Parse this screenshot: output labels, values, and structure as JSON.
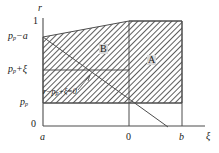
{
  "figure": {
    "type": "math-region-diagram",
    "axes": {
      "y": {
        "name": "r",
        "ticks": [
          "0",
          "p_p",
          "p_p+ξ",
          "p_p−a",
          "1"
        ]
      },
      "x": {
        "name": "ξ",
        "ticks": [
          "a",
          "0",
          "b"
        ]
      }
    },
    "y_ticks": {
      "zero": "0",
      "pp": "p",
      "pp_sub": "p",
      "pp_xi_lead": "p",
      "pp_xi_sub": "p",
      "pp_xi_tail": "+ξ",
      "pp_a_lead": "p",
      "pp_a_sub": "p",
      "pp_a_tail": "−a",
      "one": "1"
    },
    "x_ticks": {
      "a": "a",
      "zero": "0",
      "b": "b"
    },
    "regions": [
      {
        "id": "B",
        "label": "B"
      },
      {
        "id": "A",
        "label": "A"
      }
    ],
    "annotation": {
      "text": "r−p_p+ξ=0",
      "lead": "r−p",
      "sub": "p",
      "tail": "+ξ=0"
    },
    "colors": {
      "line": "#4d4d4d",
      "hatch": "#555555",
      "text": "#1a1a1a",
      "label_bg": "#d9d9d9",
      "background": "#ffffff"
    }
  }
}
